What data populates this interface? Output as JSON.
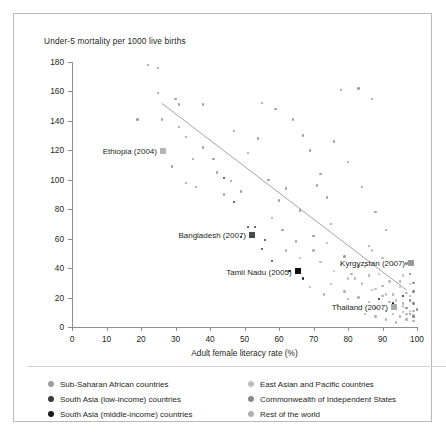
{
  "figure": {
    "y_axis_title": "Under-5 mortality per 1000 live births",
    "x_axis_title": "Adult female literacy rate (%)"
  },
  "legend": {
    "items": [
      {
        "label": "Sub-Saharan African countries",
        "color": "#9e9e9e",
        "column": 1
      },
      {
        "label": "South Asia (low-income) countries",
        "color": "#3a3a3a",
        "column": 1
      },
      {
        "label": "South Asia (middle-income) countries",
        "color": "#1a1a1a",
        "column": 1
      },
      {
        "label": "East Asian and Pacific countries",
        "color": "#bdbdbd",
        "column": 2
      },
      {
        "label": "Commonwealth of Independent States",
        "color": "#8a8a8a",
        "column": 2
      },
      {
        "label": "Rest of the world",
        "color": "#b0b0b0",
        "column": 2
      }
    ]
  },
  "chart_data": {
    "type": "scatter",
    "title": "",
    "xlabel": "Adult female literacy rate (%)",
    "ylabel": "Under-5 mortality per 1000 live births",
    "xlim": [
      0,
      100
    ],
    "ylim": [
      0,
      180
    ],
    "xticks": [
      0,
      10,
      20,
      30,
      40,
      50,
      60,
      70,
      80,
      90,
      100
    ],
    "yticks": [
      0,
      20,
      40,
      60,
      80,
      100,
      120,
      140,
      160,
      180
    ],
    "grid": false,
    "legend_position": "below-plot",
    "trendline": {
      "x0": 26,
      "y0": 152,
      "x1": 97,
      "y1": 25,
      "color": "#9a9a9a"
    },
    "annotations": [
      {
        "label": "Ethiopia (2004)",
        "x": 26,
        "y": 119,
        "marker": "square",
        "color": "#b5b5b5"
      },
      {
        "label": "Bangladesh (2007)",
        "x": 52,
        "y": 62,
        "marker": "square",
        "color": "#4a4a4a"
      },
      {
        "label": "Tamil Nadu (2005)",
        "x": 65,
        "y": 37,
        "marker": "square",
        "color": "#111111"
      },
      {
        "label": "Kyrgyzstan (2007)",
        "x": 98,
        "y": 43,
        "marker": "square",
        "color": "#9a9a9a"
      },
      {
        "label": "Thailand (2007)",
        "x": 93,
        "y": 13,
        "marker": "square",
        "color": "#a8a8a8"
      }
    ],
    "series": [
      {
        "name": "Sub-Saharan African countries",
        "color": "#9e9e9e",
        "points": [
          [
            22,
            178
          ],
          [
            25,
            176
          ],
          [
            25,
            159
          ],
          [
            19,
            141
          ],
          [
            26,
            141
          ],
          [
            31,
            151
          ],
          [
            38,
            151
          ],
          [
            31,
            136
          ],
          [
            33,
            129
          ],
          [
            35,
            114
          ],
          [
            29,
            109
          ],
          [
            33,
            98
          ],
          [
            36,
            95
          ],
          [
            41,
            114
          ],
          [
            44,
            90
          ],
          [
            30,
            155
          ],
          [
            38,
            122
          ],
          [
            42,
            105
          ],
          [
            46,
            99
          ],
          [
            49,
            92
          ],
          [
            54,
            128
          ],
          [
            47,
            133
          ],
          [
            51,
            118
          ],
          [
            57,
            100
          ],
          [
            60,
            86
          ],
          [
            62,
            94
          ],
          [
            66,
            79
          ],
          [
            55,
            152
          ],
          [
            59,
            148
          ],
          [
            64,
            141
          ],
          [
            69,
            120
          ],
          [
            72,
            104
          ],
          [
            67,
            130
          ],
          [
            74,
            88
          ],
          [
            71,
            96
          ],
          [
            78,
            161
          ],
          [
            83,
            162
          ],
          [
            87,
            155
          ],
          [
            76,
            126
          ],
          [
            80,
            112
          ],
          [
            61,
            66
          ],
          [
            65,
            58
          ],
          [
            58,
            74
          ],
          [
            70,
            62
          ],
          [
            75,
            70
          ],
          [
            84,
            95
          ],
          [
            88,
            78
          ],
          [
            91,
            66
          ],
          [
            86,
            55
          ],
          [
            79,
            48
          ]
        ]
      },
      {
        "name": "South Asia (low-income) countries",
        "color": "#3a3a3a",
        "points": [
          [
            47,
            85
          ],
          [
            51,
            68
          ],
          [
            53,
            68
          ],
          [
            55,
            53
          ],
          [
            44,
            101
          ],
          [
            58,
            45
          ],
          [
            49,
            61
          ],
          [
            56,
            59
          ]
        ]
      },
      {
        "name": "South Asia (middle-income) countries",
        "color": "#1a1a1a",
        "points": [
          [
            63,
            38
          ],
          [
            67,
            33
          ],
          [
            89,
            19
          ],
          [
            93,
            16
          ],
          [
            96,
            21
          ]
        ]
      },
      {
        "name": "East Asian and Pacific countries",
        "color": "#bdbdbd",
        "points": [
          [
            72,
            44
          ],
          [
            76,
            38
          ],
          [
            80,
            33
          ],
          [
            84,
            30
          ],
          [
            88,
            26
          ],
          [
            91,
            22
          ],
          [
            94,
            18
          ],
          [
            96,
            14
          ],
          [
            98,
            11
          ],
          [
            99,
            8
          ],
          [
            85,
            41
          ],
          [
            89,
            36
          ],
          [
            92,
            31
          ],
          [
            95,
            27
          ],
          [
            97,
            23
          ],
          [
            93,
            42
          ],
          [
            90,
            47
          ],
          [
            87,
            52
          ],
          [
            96,
            35
          ],
          [
            98,
            29
          ]
        ]
      },
      {
        "name": "Commonwealth of Independent States",
        "color": "#8a8a8a",
        "points": [
          [
            97,
            43
          ],
          [
            98,
            36
          ],
          [
            99,
            30
          ],
          [
            99,
            24
          ],
          [
            98,
            18
          ],
          [
            97,
            13
          ],
          [
            99,
            16
          ],
          [
            98,
            9
          ],
          [
            99,
            7
          ],
          [
            100,
            12
          ]
        ]
      },
      {
        "name": "Rest of the world",
        "color": "#b0b0b0",
        "points": [
          [
            62,
            52
          ],
          [
            66,
            47
          ],
          [
            70,
            52
          ],
          [
            74,
            57
          ],
          [
            78,
            42
          ],
          [
            81,
            36
          ],
          [
            75,
            29
          ],
          [
            79,
            24
          ],
          [
            83,
            20
          ],
          [
            86,
            17
          ],
          [
            88,
            13
          ],
          [
            91,
            11
          ],
          [
            93,
            9
          ],
          [
            95,
            7
          ],
          [
            97,
            5
          ],
          [
            99,
            4
          ],
          [
            96,
            10
          ],
          [
            94,
            13
          ],
          [
            92,
            17
          ],
          [
            90,
            21
          ],
          [
            87,
            25
          ],
          [
            84,
            29
          ],
          [
            82,
            33
          ],
          [
            80,
            19
          ],
          [
            77,
            15
          ],
          [
            73,
            22
          ],
          [
            69,
            27
          ],
          [
            85,
            9
          ],
          [
            88,
            7
          ],
          [
            91,
            5
          ],
          [
            94,
            3
          ],
          [
            97,
            9
          ],
          [
            99,
            11
          ],
          [
            96,
            16
          ],
          [
            93,
            22
          ],
          [
            90,
            28
          ],
          [
            86,
            35
          ],
          [
            83,
            41
          ],
          [
            98,
            21
          ],
          [
            95,
            31
          ]
        ]
      }
    ]
  }
}
